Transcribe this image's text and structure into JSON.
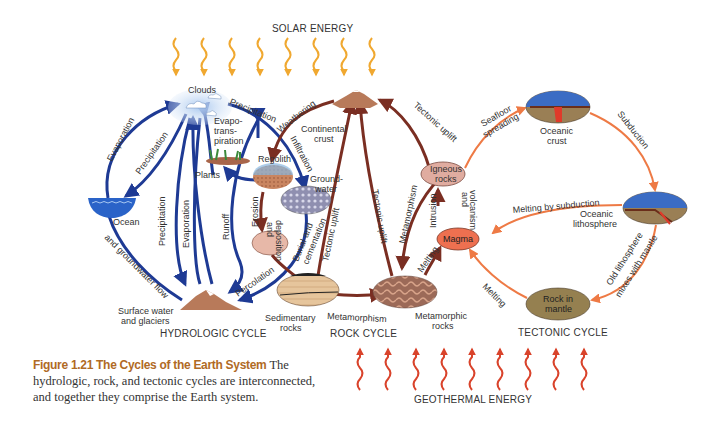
{
  "energy": {
    "solar": "SOLAR ENERGY",
    "geothermal": "GEOTHERMAL ENERGY"
  },
  "cycles": {
    "hydrologic": "HYDROLOGIC CYCLE",
    "rock": "ROCK CYCLE",
    "tectonic": "TECTONIC CYCLE"
  },
  "nodes": {
    "clouds": "Clouds",
    "ocean": "Ocean",
    "plants": "Plants",
    "regolith": "Regolith",
    "groundwater_1": "Ground-",
    "groundwater_2": "water",
    "surface_1": "Surface water",
    "surface_2": "and glaciers",
    "continental_1": "Continental",
    "continental_2": "crust",
    "sedimentary_1": "Sedimentary",
    "sedimentary_2": "rocks",
    "metamorphic_1": "Metamorphic",
    "metamorphic_2": "rocks",
    "igneous_1": "Igneous",
    "igneous_2": "rocks",
    "magma": "Magma",
    "oceanic_crust_1": "Oceanic",
    "oceanic_crust_2": "crust",
    "oceanic_litho_1": "Oceanic",
    "oceanic_litho_2": "lithosphere",
    "mantle_1": "Rock in",
    "mantle_2": "mantle"
  },
  "processes": {
    "evaporation": "Evaporation",
    "precipitation": "Precipitation",
    "precipitation2": "Precipitation",
    "evaporation2": "Evaporation",
    "runoff": "Runoff",
    "groundwater_flow": "and groundwater flow",
    "evapo_1": "Evapo-",
    "evapo_2": "trans-",
    "evapo_3": "piration",
    "precip_top": "Precipitation",
    "infiltration": "Infiltration",
    "weathering": "Weathering",
    "erosion_1": "Erosion",
    "erosion_2": "and",
    "erosion_3": "deposition",
    "burial_1": "Burial and",
    "burial_2": "cementation",
    "tectonic_uplift_1": "Tectonic uplift",
    "tectonic_uplift_2": "Tectonic uplift",
    "tectonic_uplift_3": "Tectonic uplift",
    "percolation": "Percolation",
    "metamorphism_1": "Metamorphism",
    "metamorphism_2": "Metamorphism",
    "intrusion_1": "Intrusion",
    "intrusion_2": "and",
    "intrusion_3": "volcanism",
    "melting_1": "Melting",
    "melting_2": "Melting",
    "seafloor_1": "Seafloor",
    "seafloor_2": "spreading",
    "subduction": "Subduction",
    "melting_subduction": "Melting by subduction",
    "old_litho_1": "Old lithosphere",
    "old_litho_2": "mixes with mantle"
  },
  "caption": {
    "figure_label": "Figure 1.21 The Cycles of the Earth System",
    "text": " The hydrologic, rock, and tectonic cycles are interconnected, and together they comprise the Earth system."
  },
  "colors": {
    "hydrologic": "#1e3a94",
    "rock": "#7a2e22",
    "tectonic": "#ee7a45",
    "solar": "#f0a830",
    "geothermal": "#d9432b",
    "caption_accent": "#b06a25"
  }
}
